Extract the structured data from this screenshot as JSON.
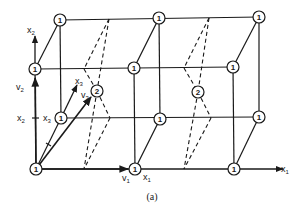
{
  "figure": {
    "caption": "(a)",
    "colors": {
      "line": "#1a1a1a",
      "background": "#ffffff"
    },
    "nodes": [
      {
        "id": "n-origin",
        "label": "1",
        "x": 36,
        "y": 169
      },
      {
        "id": "n-v1",
        "label": "1",
        "x": 135,
        "y": 169
      },
      {
        "id": "n-bottom-right",
        "label": "1",
        "x": 234,
        "y": 169
      },
      {
        "id": "n-left-mid",
        "label": "1",
        "x": 35,
        "y": 69
      },
      {
        "id": "n-mid-mid",
        "label": "1",
        "x": 134,
        "y": 68
      },
      {
        "id": "n-right-mid",
        "label": "1",
        "x": 233,
        "y": 67
      },
      {
        "id": "n-back-left-low",
        "label": "1",
        "x": 61,
        "y": 118
      },
      {
        "id": "n-back-mid-low",
        "label": "1",
        "x": 160,
        "y": 119
      },
      {
        "id": "n-back-right-low",
        "label": "1",
        "x": 259,
        "y": 117
      },
      {
        "id": "n-back-left-top",
        "label": "1",
        "x": 60,
        "y": 20
      },
      {
        "id": "n-back-mid-top",
        "label": "1",
        "x": 159,
        "y": 18
      },
      {
        "id": "n-back-right-top",
        "label": "1",
        "x": 259,
        "y": 17
      },
      {
        "id": "n-v3",
        "label": "2",
        "x": 97,
        "y": 91
      },
      {
        "id": "n-center-right",
        "label": "2",
        "x": 198,
        "y": 92
      }
    ],
    "labels": {
      "x1_axis": "x",
      "x1_axis_sub": "1",
      "x2_axis": "x",
      "x2_axis_sub": "2",
      "x3_axis": "x",
      "x3_axis_sub": "3",
      "v1": "v",
      "v1_sub": "1",
      "v2": "v",
      "v2_sub": "2",
      "v3": "v",
      "v3_sub": "3",
      "x1_tick": "x",
      "x1_tick_sub": "1",
      "x2_tick": "x",
      "x2_tick_sub": "2",
      "x3_tick": "x",
      "x3_tick_sub": "3"
    }
  }
}
